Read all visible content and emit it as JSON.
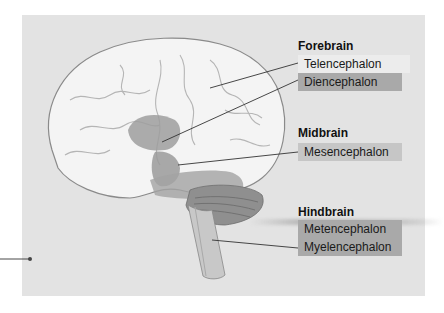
{
  "diagram": {
    "groups": [
      {
        "title": "Forebrain",
        "labels": [
          "Telencephalon",
          "Diencephalon"
        ]
      },
      {
        "title": "Midbrain",
        "labels": [
          "Mesencephalon"
        ]
      },
      {
        "title": "Hindbrain",
        "labels": [
          "Metencephalon",
          "Myelencephalon"
        ]
      }
    ],
    "colors": {
      "panel": "#e3e3e3",
      "brain": "#f2f2f2",
      "highlight_region": "#9e9e9e",
      "leader_line": "#333333"
    }
  }
}
